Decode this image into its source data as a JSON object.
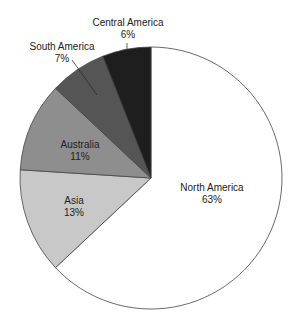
{
  "chart_data": {
    "type": "pie",
    "title": "",
    "categories": [
      "North America",
      "Asia",
      "Australia",
      "South America",
      "Central America"
    ],
    "values": [
      63,
      13,
      11,
      7,
      6
    ],
    "unit": "%",
    "colors": [
      "#ffffff",
      "#c8c8c8",
      "#8e8e8e",
      "#555555",
      "#1e1e1e"
    ],
    "start_angle_deg": 0,
    "direction": "clockwise",
    "legend": "none",
    "labels": [
      {
        "name": "North America",
        "pct": "63%",
        "x": 212,
        "y": 191,
        "inside": true
      },
      {
        "name": "Asia",
        "pct": "13%",
        "x": 74,
        "y": 204,
        "inside": true
      },
      {
        "name": "Australia",
        "pct": "11%",
        "x": 80,
        "y": 148,
        "inside": true
      },
      {
        "name": "South America",
        "pct": "7%",
        "x": 62,
        "y": 50,
        "inside": false,
        "leader": [
          72,
          60,
          97,
          95
        ]
      },
      {
        "name": "Central America",
        "pct": "6%",
        "x": 128,
        "y": 26,
        "inside": false,
        "leader": [
          127,
          43,
          127,
          55
        ]
      }
    ]
  }
}
